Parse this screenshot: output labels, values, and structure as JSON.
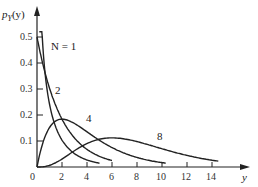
{
  "chart_data": {
    "type": "line",
    "title": "",
    "xlabel": "y",
    "ylabel": "p_Y(y)",
    "xlim": [
      0,
      15
    ],
    "ylim": [
      0,
      0.55
    ],
    "xticks": [
      "0",
      "2",
      "4",
      "6",
      "8",
      "10",
      "12",
      "14"
    ],
    "yticks": [
      "0.1",
      "0.2",
      "0.3",
      "0.4",
      "0.5"
    ],
    "grid": false,
    "legend": "inline curve labels",
    "series": [
      {
        "name": "N = 1",
        "label": "N = 1",
        "x": [
          0.2,
          0.5,
          1,
          1.5,
          2,
          3,
          4,
          5
        ],
        "values": [
          0.484,
          0.352,
          0.242,
          0.18,
          0.104,
          0.051,
          0.027,
          0.015
        ]
      },
      {
        "name": "2",
        "label": "2",
        "x": [
          0,
          1,
          2,
          3,
          4,
          5,
          6
        ],
        "values": [
          0.5,
          0.303,
          0.184,
          0.112,
          0.068,
          0.041,
          0.025
        ]
      },
      {
        "name": "4",
        "label": "4",
        "x": [
          0,
          1,
          2,
          3,
          4,
          6,
          8,
          10
        ],
        "values": [
          0,
          0.152,
          0.184,
          0.167,
          0.135,
          0.075,
          0.037,
          0.017
        ]
      },
      {
        "name": "8",
        "label": "8",
        "x": [
          0,
          2,
          4,
          6,
          8,
          10,
          12,
          14
        ],
        "values": [
          0,
          0.031,
          0.09,
          0.112,
          0.098,
          0.073,
          0.045,
          0.026
        ]
      }
    ]
  },
  "labels": {
    "yaxis": "p",
    "yaxis_sub": "Y",
    "yaxis_arg": "(y)",
    "xaxis": "y",
    "origin": "0",
    "curve_n1": "N = 1",
    "curve_2": "2",
    "curve_4": "4",
    "curve_8": "8"
  },
  "ticks": {
    "x": [
      "2",
      "4",
      "6",
      "8",
      "10",
      "12",
      "14"
    ],
    "y": [
      "0.1",
      "0.2",
      "0.3",
      "0.4",
      "0.5"
    ]
  }
}
